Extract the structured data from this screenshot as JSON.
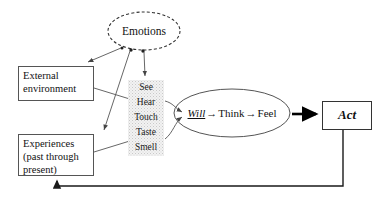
{
  "diagram": {
    "emotions": {
      "label": "Emotions",
      "shape": "dashed-ellipse"
    },
    "boxes": [
      {
        "id": "external",
        "label": "External\nenvironment"
      },
      {
        "id": "experiences",
        "label": "Experiences\n(past through\npresent)"
      },
      {
        "id": "act",
        "label": "Act"
      }
    ],
    "external": {
      "line1": "External",
      "line2": "environment"
    },
    "experiences": {
      "line1": "Experiences",
      "line2": "(past through",
      "line3": "present)"
    },
    "act": {
      "label": "Act"
    },
    "senses": {
      "items": [
        "See",
        "Hear",
        "Touch",
        "Taste",
        "Smell"
      ]
    },
    "process": {
      "step1": "Will",
      "arrow1": "→",
      "step2": "Think",
      "arrow2": "→",
      "step3": "Feel"
    },
    "colors": {
      "stroke": "#555555",
      "act_stroke": "#333333",
      "text": "#111111",
      "senses_fill": "#f2f2f2",
      "thick_arrow": "#000000"
    }
  }
}
